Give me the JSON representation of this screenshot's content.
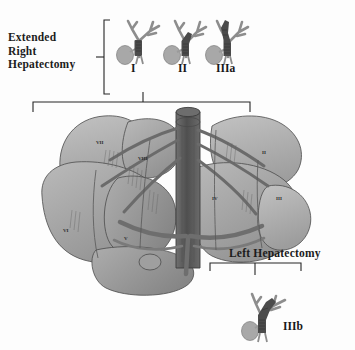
{
  "figure": {
    "kind": "medical-illustration",
    "palette": {
      "ink": "#1c1c1c",
      "liver_light": "#b4b4b4",
      "liver_mid": "#9a9a9a",
      "liver_dark": "#7c7c7c",
      "vessel": "#6f6f6f",
      "vena_cava": "#5d5d5d",
      "tumor": "#4a4a4a",
      "duct": "#8f8f8f",
      "gallbladder": "#a6a6a6",
      "outline": "#3a3a3a",
      "background": "#ffffff"
    }
  },
  "annotations": {
    "extended_right_hepatectomy": {
      "label": "Extended\nRight\nHepatectomy",
      "line1": "Extended",
      "line2": "Right",
      "line3": "Hepatectomy"
    },
    "left_hepatectomy": {
      "label": "Left Hepatectomy"
    }
  },
  "tumor_types": [
    {
      "id": "type-I",
      "label": "I",
      "description": "Tumor confined to common hepatic duct below the confluence",
      "tumor_extent": "common-hepatic-duct",
      "grouped_under": "Extended Right Hepatectomy"
    },
    {
      "id": "type-II",
      "label": "II",
      "description": "Tumor involving the biliary confluence",
      "tumor_extent": "confluence",
      "grouped_under": "Extended Right Hepatectomy"
    },
    {
      "id": "type-IIIa",
      "label": "IIIa",
      "description": "Tumor extending into the right hepatic duct",
      "tumor_extent": "right-hepatic-duct",
      "grouped_under": "Extended Right Hepatectomy"
    },
    {
      "id": "type-IIIb",
      "label": "IIIb",
      "description": "Tumor extending into the left hepatic duct",
      "tumor_extent": "left-hepatic-duct",
      "grouped_under": "Left Hepatectomy"
    }
  ],
  "liver": {
    "segments": [
      {
        "label": "VII",
        "x": 96,
        "y": 140
      },
      {
        "label": "VIII",
        "x": 138,
        "y": 156
      },
      {
        "label": "II",
        "x": 262,
        "y": 150
      },
      {
        "label": "IV",
        "x": 212,
        "y": 196
      },
      {
        "label": "III",
        "x": 276,
        "y": 196
      },
      {
        "label": "VI",
        "x": 63,
        "y": 228
      },
      {
        "label": "V",
        "x": 124,
        "y": 236
      }
    ],
    "structures": [
      "inferior vena cava",
      "portal vein",
      "hepatic veins",
      "hepatic artery",
      "gallbladder",
      "biliary tree"
    ]
  },
  "brackets": [
    {
      "id": "bracket-extended-right",
      "orientation": "vertical-right",
      "spans": [
        "I",
        "II",
        "IIIa"
      ]
    },
    {
      "id": "bracket-liver-span",
      "orientation": "horizontal-down",
      "spans": [
        "liver"
      ]
    },
    {
      "id": "bracket-left-hepatectomy",
      "orientation": "horizontal-down",
      "spans": [
        "IIIb"
      ]
    }
  ]
}
